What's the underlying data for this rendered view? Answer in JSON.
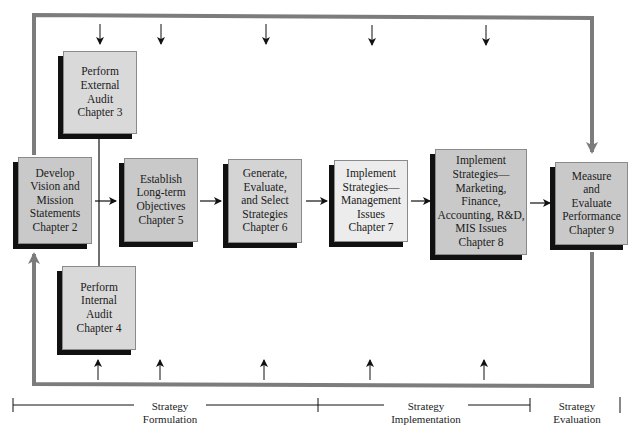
{
  "diagram": {
    "type": "strategic-management-model",
    "colors": {
      "box_fill": "#c9c9c9",
      "box_fill_light": "#ececec",
      "box_fill_ext": "#d9d9d9",
      "shadow": "#111111",
      "feedback_loop": "#7c7c7c",
      "arrow": "#111111"
    },
    "boxes": [
      {
        "id": "external-audit",
        "label": "Perform\nExternal\nAudit\nChapter 3"
      },
      {
        "id": "vision-mission",
        "label": "Develop\nVision and\nMission\nStatements\nChapter 2"
      },
      {
        "id": "long-term-objectives",
        "label": "Establish\nLong-term\nObjectives\nChapter 5"
      },
      {
        "id": "generate-strategies",
        "label": "Generate,\nEvaluate,\nand Select\nStrategies\nChapter 6"
      },
      {
        "id": "implement-management",
        "label": "Implement\nStrategies—\nManagement\nIssues\nChapter 7"
      },
      {
        "id": "implement-functional",
        "label": "Implement\nStrategies—\nMarketing,\nFinance,\nAccounting, R&D,\nMIS Issues\nChapter 8"
      },
      {
        "id": "measure-evaluate",
        "label": "Measure\nand\nEvaluate\nPerformance\nChapter 9"
      },
      {
        "id": "internal-audit",
        "label": "Perform\nInternal\nAudit\nChapter 4"
      }
    ],
    "phases": [
      {
        "id": "formulation",
        "label": "Strategy\nFormulation"
      },
      {
        "id": "implementation",
        "label": "Strategy\nImplementation"
      },
      {
        "id": "evaluation",
        "label": "Strategy\nEvaluation"
      }
    ]
  }
}
